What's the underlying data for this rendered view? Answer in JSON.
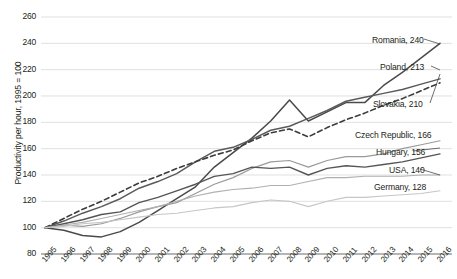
{
  "chart_data": {
    "type": "line",
    "title": "",
    "xlabel": "",
    "ylabel": "Productivity per hour, 1995 = 100",
    "ylim": [
      80,
      260
    ],
    "yticks": [
      80,
      100,
      120,
      140,
      160,
      180,
      200,
      220,
      240,
      260
    ],
    "grid": true,
    "legend_position": "right-inline-labels",
    "x": [
      1995,
      1996,
      1997,
      1998,
      1999,
      2000,
      2001,
      2002,
      2003,
      2004,
      2005,
      2006,
      2007,
      2008,
      2009,
      2010,
      2011,
      2012,
      2013,
      2014,
      2015,
      2016
    ],
    "xticklabels": [
      "1995",
      "1996",
      "1997",
      "1998",
      "1999",
      "2000",
      "2001",
      "2002",
      "2003",
      "2004",
      "2005",
      "2006",
      "2007",
      "2008",
      "2009",
      "2010",
      "2011",
      "2012",
      "2013",
      "2014",
      "2015",
      "2016"
    ],
    "series": [
      {
        "name": "Romania",
        "label": "Romania, 240",
        "end_value": 240,
        "color": "#4a4a4a",
        "dash": false,
        "width": 1.5,
        "values": [
          100,
          98,
          94,
          93,
          97,
          104,
          113,
          122,
          131,
          146,
          157,
          168,
          181,
          197,
          181,
          188,
          195,
          195,
          208,
          218,
          229,
          240
        ]
      },
      {
        "name": "Poland",
        "label": "Poland, 213",
        "end_value": 213,
        "color": "#5a5a5a",
        "dash": false,
        "width": 1.5,
        "values": [
          100,
          105,
          111,
          116,
          122,
          130,
          135,
          141,
          150,
          158,
          161,
          167,
          174,
          177,
          183,
          189,
          196,
          199,
          202,
          205,
          209,
          213
        ]
      },
      {
        "name": "Slovakia",
        "label": "Slovakia, 210",
        "end_value": 210,
        "color": "#3d3d3d",
        "dash": true,
        "width": 1.6,
        "values": [
          100,
          107,
          114,
          120,
          127,
          134,
          139,
          145,
          150,
          155,
          159,
          166,
          172,
          175,
          169,
          176,
          182,
          187,
          193,
          198,
          204,
          210
        ]
      },
      {
        "name": "Czech Republic",
        "label": "Czech Republic, 166",
        "end_value": 166,
        "color": "#9a9a9a",
        "dash": false,
        "width": 1.2,
        "values": [
          100,
          102,
          101,
          103,
          107,
          112,
          116,
          119,
          126,
          133,
          138,
          145,
          150,
          151,
          146,
          151,
          154,
          154,
          156,
          160,
          163,
          166
        ]
      },
      {
        "name": "Hungary",
        "label": "Hungary, 156",
        "end_value": 156,
        "color": "#555555",
        "dash": false,
        "width": 1.4,
        "values": [
          100,
          103,
          106,
          110,
          112,
          119,
          123,
          128,
          133,
          139,
          141,
          146,
          145,
          146,
          140,
          145,
          147,
          146,
          148,
          150,
          153,
          156
        ]
      },
      {
        "name": "USA",
        "label": "USA, 140",
        "end_value": 140,
        "color": "#b0b0b0",
        "dash": false,
        "width": 1.1,
        "values": [
          100,
          102,
          104,
          107,
          110,
          113,
          116,
          120,
          124,
          127,
          129,
          130,
          132,
          132,
          135,
          138,
          138,
          139,
          139,
          139,
          140,
          140
        ]
      },
      {
        "name": "Germany",
        "label": "Germany, 128",
        "end_value": 128,
        "color": "#c6c6c6",
        "dash": false,
        "width": 1.1,
        "values": [
          100,
          101,
          103,
          104,
          106,
          108,
          110,
          111,
          113,
          115,
          116,
          119,
          121,
          120,
          116,
          120,
          123,
          123,
          124,
          125,
          126,
          128
        ]
      }
    ],
    "series_labels": [
      {
        "text": "Romania, 240",
        "x": 372,
        "y": 35
      },
      {
        "text": "Poland, 213",
        "x": 380,
        "y": 62
      },
      {
        "text": "Slovakia, 210",
        "x": 373,
        "y": 99
      },
      {
        "text": "Czech Republic, 166",
        "x": 355,
        "y": 130
      },
      {
        "text": "Hungary, 156",
        "x": 376,
        "y": 147
      },
      {
        "text": "USA, 140",
        "x": 389,
        "y": 165
      },
      {
        "text": "Germany, 128",
        "x": 374,
        "y": 182
      }
    ],
    "leaders": [
      {
        "from": [
          440,
          44
        ],
        "to": [
          424,
          39
        ]
      },
      {
        "from": [
          440,
          70
        ],
        "to": [
          431,
          66
        ]
      },
      {
        "from": [
          440,
          74
        ],
        "to": [
          430,
          103
        ]
      },
      {
        "from": [
          440,
          148
        ],
        "to": [
          413,
          151
        ]
      },
      {
        "from": [
          440,
          175
        ],
        "to": [
          420,
          169
        ]
      }
    ]
  }
}
